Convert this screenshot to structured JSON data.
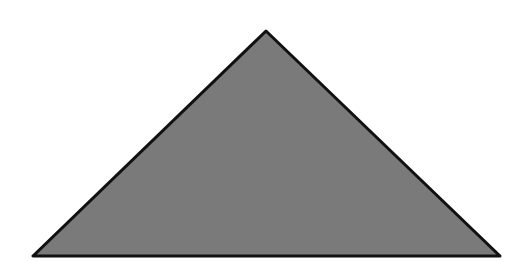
{
  "diagram": {
    "shape": "triangle",
    "fill_color": "#7a7a7a",
    "stroke_color": "#111111",
    "stroke_width": 3,
    "vertices": {
      "apex": [
        266,
        31
      ],
      "bottom_left": [
        33,
        256
      ],
      "bottom_right": [
        500,
        256
      ]
    }
  }
}
